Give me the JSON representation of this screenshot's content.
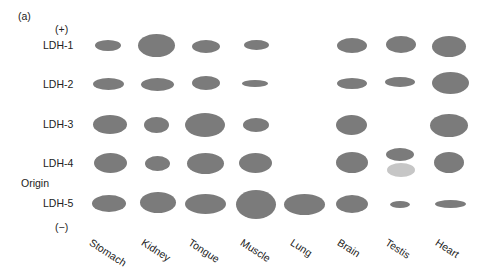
{
  "figure": {
    "panel_label": "(a)",
    "positive_pole": "(+)",
    "negative_pole": "(−)",
    "origin_label": "Origin",
    "band_color": "#7b7b7b",
    "faint_band_color": "#c6c6c6",
    "isozymes": [
      "LDH-1",
      "LDH-2",
      "LDH-3",
      "LDH-4",
      "LDH-5"
    ],
    "tissues": [
      "Stomach",
      "Kidney",
      "Tongue",
      "Muscle",
      "Lung",
      "Brain",
      "Testis",
      "Heart"
    ]
  },
  "chart_data": {
    "type": "table",
    "xlabel": "Tissue",
    "ylabel": "Isozyme (migration from (+) to (−))",
    "categories": [
      "Stomach",
      "Kidney",
      "Tongue",
      "Muscle",
      "Lung",
      "Brain",
      "Testis",
      "Heart"
    ],
    "rows": [
      "LDH-1",
      "LDH-2",
      "LDH-3",
      "LDH-4",
      "LDH-5"
    ],
    "band_size_note": "relative band area (0 = absent); extra faint band in Testis below LDH-4",
    "series": [
      {
        "name": "LDH-1",
        "values": [
          2,
          5,
          2.5,
          1.5,
          0,
          2.5,
          3,
          4
        ]
      },
      {
        "name": "LDH-2",
        "values": [
          2,
          2.5,
          2.5,
          1,
          0,
          1.5,
          1.5,
          4.5
        ]
      },
      {
        "name": "LDH-3",
        "values": [
          3,
          2,
          5.5,
          2,
          0,
          3,
          0,
          5
        ]
      },
      {
        "name": "LDH-4",
        "values": [
          3.5,
          2,
          4,
          3.5,
          0,
          3.5,
          2,
          3.5
        ]
      },
      {
        "name": "LDH-5",
        "values": [
          3,
          4.5,
          4.5,
          6.5,
          4,
          3,
          0.5,
          1.5
        ]
      }
    ],
    "extra_bands": [
      {
        "tissue": "Testis",
        "position": "between LDH-4 and LDH-5",
        "shade": "light"
      }
    ]
  },
  "bands": [
    {
      "cx": 108,
      "cy": 45,
      "rx": 13,
      "ry": 5.5
    },
    {
      "cx": 156,
      "cy": 45,
      "rx": 18.5,
      "ry": 11.5
    },
    {
      "cx": 206,
      "cy": 46,
      "rx": 14,
      "ry": 6.5
    },
    {
      "cx": 256,
      "cy": 45,
      "rx": 12.5,
      "ry": 5
    },
    {
      "cx": 352,
      "cy": 45,
      "rx": 15,
      "ry": 7.5
    },
    {
      "cx": 401,
      "cy": 44,
      "rx": 15,
      "ry": 8.5
    },
    {
      "cx": 449,
      "cy": 46,
      "rx": 17,
      "ry": 10.5
    },
    {
      "cx": 108,
      "cy": 84,
      "rx": 15.5,
      "ry": 6
    },
    {
      "cx": 157,
      "cy": 84,
      "rx": 16.5,
      "ry": 6.5
    },
    {
      "cx": 206,
      "cy": 83,
      "rx": 14,
      "ry": 7
    },
    {
      "cx": 255,
      "cy": 83,
      "rx": 13,
      "ry": 3.5
    },
    {
      "cx": 352,
      "cy": 83,
      "rx": 15,
      "ry": 5.5
    },
    {
      "cx": 400,
      "cy": 82,
      "rx": 15,
      "ry": 5
    },
    {
      "cx": 450,
      "cy": 83,
      "rx": 18.5,
      "ry": 11
    },
    {
      "cx": 110,
      "cy": 124,
      "rx": 17,
      "ry": 9.5
    },
    {
      "cx": 156,
      "cy": 125,
      "rx": 12.5,
      "ry": 8
    },
    {
      "cx": 205,
      "cy": 125,
      "rx": 20,
      "ry": 12
    },
    {
      "cx": 256,
      "cy": 125,
      "rx": 13,
      "ry": 7
    },
    {
      "cx": 351,
      "cy": 125,
      "rx": 15.5,
      "ry": 10
    },
    {
      "cx": 449,
      "cy": 125,
      "rx": 19,
      "ry": 11.5
    },
    {
      "cx": 110,
      "cy": 163,
      "rx": 16.5,
      "ry": 10
    },
    {
      "cx": 157,
      "cy": 163,
      "rx": 12.5,
      "ry": 7.5
    },
    {
      "cx": 205,
      "cy": 163,
      "rx": 18.5,
      "ry": 10.5
    },
    {
      "cx": 255,
      "cy": 163,
      "rx": 16.5,
      "ry": 10
    },
    {
      "cx": 352,
      "cy": 162,
      "rx": 16,
      "ry": 10.5
    },
    {
      "cx": 400,
      "cy": 154,
      "rx": 14,
      "ry": 6.5
    },
    {
      "cx": 449,
      "cy": 162,
      "rx": 15,
      "ry": 10.5
    },
    {
      "cx": 109,
      "cy": 203,
      "rx": 17,
      "ry": 8.5
    },
    {
      "cx": 158,
      "cy": 202,
      "rx": 18,
      "ry": 10.5
    },
    {
      "cx": 205,
      "cy": 204,
      "rx": 20.5,
      "ry": 10
    },
    {
      "cx": 256,
      "cy": 204,
      "rx": 20,
      "ry": 14.5
    },
    {
      "cx": 304,
      "cy": 204,
      "rx": 20.5,
      "ry": 10.5
    },
    {
      "cx": 352,
      "cy": 204,
      "rx": 16,
      "ry": 9
    },
    {
      "cx": 400,
      "cy": 204,
      "rx": 10,
      "ry": 3.5
    },
    {
      "cx": 450,
      "cy": 204,
      "rx": 15.5,
      "ry": 4
    }
  ],
  "faint_bands": [
    {
      "cx": 401,
      "cy": 170,
      "rx": 14,
      "ry": 7
    }
  ]
}
